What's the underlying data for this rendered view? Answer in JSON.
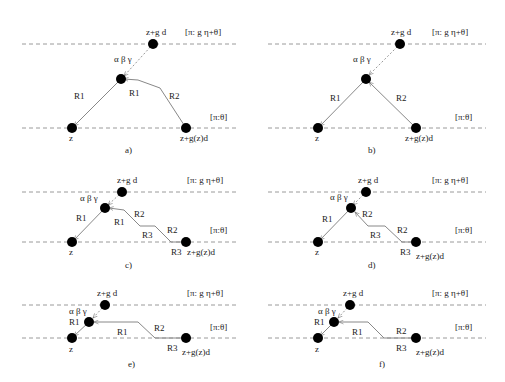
{
  "figure": {
    "dashed_line_color": "#9a9a9a",
    "node_color": "#000000",
    "edge_color": "#888888",
    "labels": {
      "top_node": "z+g d",
      "top_node_bar": "-",
      "top_node_hat": "^",
      "top_level": "[π:  g η+θ]",
      "top_level_bar": "-",
      "bottom_level": "[π:θ]",
      "left_node": "z",
      "right_node": "z+g(z)d",
      "vertex": "α β γ"
    },
    "panels": [
      {
        "id": "a",
        "caption": "a)",
        "edges": [
          "R1",
          "R1",
          "R2"
        ]
      },
      {
        "id": "b",
        "caption": "b)",
        "edges": [
          "R1",
          "R2"
        ]
      },
      {
        "id": "c",
        "caption": "c)",
        "edges": [
          "R1",
          "R1",
          "R2",
          "R3",
          "R2",
          "R3"
        ]
      },
      {
        "id": "d",
        "caption": "d)",
        "edges": [
          "R1",
          "R2",
          "R3",
          "R2",
          "R3"
        ]
      },
      {
        "id": "e",
        "caption": "e)",
        "edges": [
          "R1",
          "R1",
          "R2",
          "R3"
        ]
      },
      {
        "id": "f",
        "caption": "f)",
        "edges": [
          "R1",
          "R1",
          "R2",
          "R3"
        ]
      }
    ]
  }
}
